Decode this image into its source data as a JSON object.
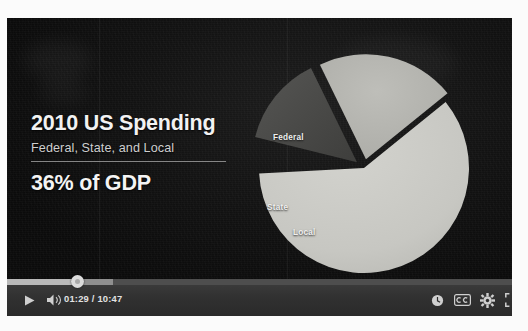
{
  "player": {
    "slide": {
      "headline": "2010 US Spending",
      "subhead": "Federal, State, and Local",
      "gdp_line": "36% of GDP"
    },
    "controls": {
      "play_label": "play-arrow",
      "volume_label": "volume-on",
      "time_display": "01:29 / 10:47",
      "current_time": "01:29",
      "duration": "10:47",
      "watch_later_label": "watch-later",
      "captions_label": "CC",
      "settings_label": "settings",
      "fullscreen_label": "fullscreen",
      "progress_percent": 14,
      "buffered_percent": 21,
      "accent_color": "#b9b9b9",
      "bar_color": "#313131"
    }
  },
  "chart_data": {
    "type": "pie",
    "title": "2010 US Spending",
    "subtitle": "Federal, State, and Local",
    "annotation": "36% of GDP",
    "categories": [
      "Federal",
      "State",
      "Local"
    ],
    "values": [
      60,
      14,
      26
    ],
    "labels": [
      "Federal",
      "State",
      "Local"
    ],
    "exploded": true,
    "legend": "none",
    "grid": false,
    "slice_colors": [
      "#c9c9c4",
      "#4a4a48",
      "#b4b4af"
    ],
    "slices": [
      {
        "name": "Federal",
        "value": 60,
        "start_deg": 321,
        "end_deg": 537,
        "color": "#c9c9c4",
        "offset": 0
      },
      {
        "name": "State",
        "value": 14,
        "start_deg": 194,
        "end_deg": 244,
        "color": "#4a4a48",
        "offset": 9
      },
      {
        "name": "Local",
        "value": 26,
        "start_deg": 244,
        "end_deg": 321,
        "color": "#b4b4af",
        "offset": 9
      }
    ]
  }
}
